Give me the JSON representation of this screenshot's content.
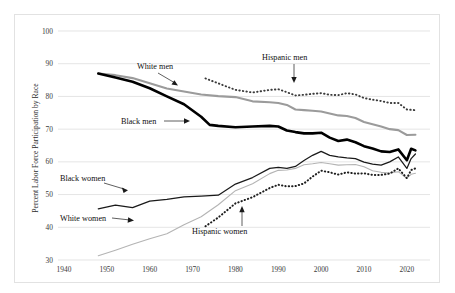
{
  "chart_data": {
    "type": "line",
    "title": "",
    "xlabel": "",
    "ylabel": "Percent Labor Force Participation by Race",
    "xlim": [
      1940,
      2024
    ],
    "ylim": [
      30,
      100
    ],
    "ytick_labels": [
      "100",
      "90",
      "80",
      "70",
      "60",
      "50",
      "40",
      "30"
    ],
    "yticks": [
      100,
      90,
      80,
      70,
      60,
      50,
      40,
      30
    ],
    "xtick_labels": [
      "1940",
      "1950",
      "1960",
      "1970",
      "1980",
      "1990",
      "2000",
      "2010",
      "2020"
    ],
    "xticks": [
      1940,
      1950,
      1960,
      1970,
      1980,
      1990,
      2000,
      2010,
      2020
    ],
    "grid": "horizontal",
    "legend": "annotations-inline",
    "series": [
      {
        "name": "White men",
        "style": "solid-gray",
        "color": "#9b9b9b",
        "x": [
          1948,
          1952,
          1956,
          1960,
          1964,
          1968,
          1972,
          1976,
          1980,
          1984,
          1988,
          1990,
          1992,
          1994,
          1996,
          1998,
          2000,
          2002,
          2004,
          2006,
          2008,
          2010,
          2012,
          2014,
          2016,
          2018,
          2020,
          2022
        ],
        "values": [
          87.0,
          86.5,
          85.6,
          84.0,
          82.4,
          81.5,
          80.6,
          80.1,
          79.8,
          78.5,
          78.2,
          78.0,
          77.4,
          76.0,
          75.8,
          75.6,
          75.4,
          74.8,
          74.2,
          74.0,
          73.4,
          72.2,
          71.5,
          70.8,
          70.0,
          69.7,
          68.2,
          68.3
        ]
      },
      {
        "name": "Black men",
        "style": "solid-black-thick",
        "color": "#000000",
        "x": [
          1948,
          1952,
          1956,
          1960,
          1964,
          1968,
          1972,
          1974,
          1976,
          1980,
          1984,
          1988,
          1990,
          1992,
          1994,
          1996,
          1998,
          2000,
          2002,
          2004,
          2006,
          2008,
          2010,
          2012,
          2014,
          2016,
          2018,
          2020,
          2021,
          2022
        ],
        "values": [
          87.0,
          85.8,
          84.5,
          82.5,
          80.0,
          77.6,
          73.8,
          71.3,
          71.0,
          70.6,
          70.8,
          71.0,
          70.8,
          69.6,
          69.1,
          68.7,
          68.7,
          68.9,
          67.4,
          66.4,
          66.8,
          66.0,
          64.8,
          64.1,
          63.2,
          63.0,
          63.8,
          60.5,
          64.0,
          63.5
        ]
      },
      {
        "name": "Hispanic men",
        "style": "dotted",
        "color": "#3b3b3b",
        "x": [
          1973,
          1976,
          1980,
          1984,
          1988,
          1990,
          1992,
          1994,
          1996,
          1998,
          2000,
          2002,
          2004,
          2006,
          2008,
          2010,
          2012,
          2014,
          2016,
          2018,
          2020,
          2022
        ],
        "values": [
          85.5,
          84.0,
          82.0,
          81.2,
          82.0,
          82.2,
          81.3,
          80.3,
          80.5,
          80.8,
          81.0,
          80.5,
          80.4,
          81.0,
          80.6,
          79.5,
          79.0,
          78.6,
          78.0,
          78.0,
          76.0,
          75.8
        ]
      },
      {
        "name": "Black women",
        "style": "solid-black-thin",
        "color": "#1a1a1a",
        "x": [
          1948,
          1952,
          1956,
          1960,
          1964,
          1968,
          1972,
          1976,
          1980,
          1984,
          1988,
          1990,
          1992,
          1994,
          1996,
          1998,
          2000,
          2002,
          2004,
          2006,
          2008,
          2010,
          2012,
          2014,
          2016,
          2018,
          2020,
          2021,
          2022
        ],
        "values": [
          45.6,
          46.8,
          46.0,
          48.0,
          48.5,
          49.3,
          49.5,
          49.8,
          53.2,
          55.2,
          58.0,
          58.3,
          58.0,
          58.6,
          60.4,
          62.0,
          63.2,
          62.0,
          61.5,
          61.2,
          61.0,
          59.9,
          59.3,
          59.0,
          60.0,
          61.5,
          58.0,
          61.0,
          62.4
        ]
      },
      {
        "name": "White women",
        "style": "solid-light-gray",
        "color": "#b4b4b4",
        "x": [
          1948,
          1952,
          1956,
          1960,
          1964,
          1968,
          1972,
          1976,
          1980,
          1984,
          1988,
          1990,
          1992,
          1994,
          1996,
          1998,
          2000,
          2002,
          2004,
          2006,
          2008,
          2010,
          2012,
          2014,
          2016,
          2018,
          2020,
          2021,
          2022
        ],
        "values": [
          31.3,
          33.0,
          34.8,
          36.5,
          38.0,
          40.8,
          43.2,
          46.9,
          51.2,
          53.3,
          56.4,
          57.4,
          57.5,
          58.0,
          59.1,
          59.4,
          59.8,
          59.4,
          59.0,
          59.1,
          59.2,
          58.5,
          57.3,
          56.8,
          56.6,
          57.0,
          55.0,
          56.2,
          56.5
        ]
      },
      {
        "name": "Hispanic women",
        "style": "dotted",
        "color": "#1f1f1f",
        "x": [
          1973,
          1976,
          1980,
          1984,
          1988,
          1990,
          1992,
          1994,
          1996,
          1998,
          2000,
          2002,
          2004,
          2006,
          2008,
          2010,
          2012,
          2014,
          2016,
          2018,
          2020,
          2021,
          2022
        ],
        "values": [
          40.3,
          43.0,
          47.3,
          49.2,
          52.0,
          53.0,
          52.5,
          52.6,
          53.4,
          55.5,
          57.3,
          56.8,
          56.1,
          56.8,
          56.4,
          56.5,
          56.0,
          56.0,
          56.4,
          58.0,
          55.0,
          57.5,
          58.0
        ]
      }
    ],
    "annotations": [
      {
        "name": "white-men",
        "label": "White men"
      },
      {
        "name": "black-men",
        "label": "Black men"
      },
      {
        "name": "hispanic-men",
        "label": "Hispanic men"
      },
      {
        "name": "black-women",
        "label": "Black women"
      },
      {
        "name": "white-women",
        "label": "White women"
      },
      {
        "name": "hispanic-women",
        "label": "Hispanic women"
      }
    ]
  },
  "axes": {
    "y_title": "Percent Labor Force Participation by Race",
    "y_ticks": [
      {
        "label": "100"
      },
      {
        "label": "90"
      },
      {
        "label": "80"
      },
      {
        "label": "70"
      },
      {
        "label": "60"
      },
      {
        "label": "50"
      },
      {
        "label": "40"
      },
      {
        "label": "30"
      }
    ],
    "x_ticks": [
      {
        "label": "1940"
      },
      {
        "label": "1950"
      },
      {
        "label": "1960"
      },
      {
        "label": "1970"
      },
      {
        "label": "1980"
      },
      {
        "label": "1990"
      },
      {
        "label": "2000"
      },
      {
        "label": "2010"
      },
      {
        "label": "2020"
      }
    ]
  },
  "labels": {
    "white_men": "White men",
    "black_men": "Black men",
    "hispanic_men": "Hispanic men",
    "black_women": "Black women",
    "white_women": "White women",
    "hispanic_women": "Hispanic women"
  },
  "colors": {
    "grid": "#d9d9d9",
    "frame": "#e2e2e2",
    "black_series": "#000000",
    "gray_series": "#9b9b9b",
    "light_gray_series": "#b4b4b4",
    "dotted_series": "#3b3b3b"
  }
}
